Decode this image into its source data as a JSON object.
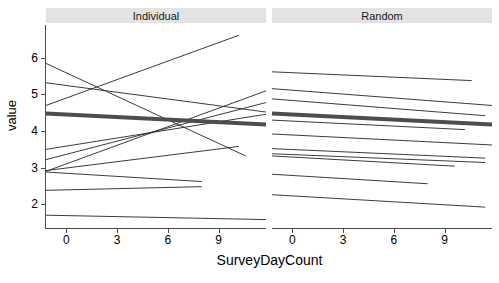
{
  "chart_data": {
    "type": "line",
    "title": "",
    "xlabel": "SurveyDayCount",
    "ylabel": "value",
    "xlim": [
      -1.2,
      11.8
    ],
    "ylim": [
      1.35,
      6.9
    ],
    "grid": false,
    "legend": false,
    "xticks": [
      0,
      3,
      6,
      9
    ],
    "yticks": [
      2,
      3,
      4,
      5,
      6
    ],
    "xtick_labels": [
      "0",
      "3",
      "6",
      "9"
    ],
    "ytick_labels": [
      "2",
      "3",
      "4",
      "5",
      "6"
    ],
    "facets": [
      {
        "label": "Individual",
        "average_line": {
          "name": "population average",
          "color": "#4d4d4d",
          "width": 4,
          "x": [
            -1.2,
            11.8
          ],
          "y": [
            4.48,
            4.18
          ]
        },
        "series": [
          {
            "name": "subject-1",
            "x": [
              -1.2,
              10.6
            ],
            "y": [
              5.85,
              3.32
            ]
          },
          {
            "name": "subject-2",
            "x": [
              -1.2,
              11.8
            ],
            "y": [
              5.32,
              4.52
            ]
          },
          {
            "name": "subject-3",
            "x": [
              -1.2,
              10.2
            ],
            "y": [
              4.7,
              6.62
            ]
          },
          {
            "name": "subject-4",
            "x": [
              -1.2,
              11.8
            ],
            "y": [
              3.5,
              4.46
            ]
          },
          {
            "name": "subject-5",
            "x": [
              -1.2,
              11.8
            ],
            "y": [
              3.22,
              4.78
            ]
          },
          {
            "name": "subject-6",
            "x": [
              -1.2,
              8.0
            ],
            "y": [
              2.88,
              2.62
            ]
          },
          {
            "name": "subject-7",
            "x": [
              -1.2,
              11.8
            ],
            "y": [
              2.9,
              5.1
            ]
          },
          {
            "name": "subject-8",
            "x": [
              -1.2,
              10.2
            ],
            "y": [
              2.92,
              3.58
            ]
          },
          {
            "name": "subject-9",
            "x": [
              -1.2,
              8.0
            ],
            "y": [
              2.38,
              2.48
            ]
          },
          {
            "name": "subject-10",
            "x": [
              -1.2,
              11.8
            ],
            "y": [
              1.7,
              1.58
            ]
          }
        ]
      },
      {
        "label": "Random",
        "average_line": {
          "name": "population average",
          "color": "#4d4d4d",
          "width": 4,
          "x": [
            -1.2,
            11.8
          ],
          "y": [
            4.48,
            4.18
          ]
        },
        "series": [
          {
            "name": "subject-1",
            "x": [
              -1.2,
              10.6
            ],
            "y": [
              5.62,
              5.38
            ]
          },
          {
            "name": "subject-2",
            "x": [
              -1.2,
              11.8
            ],
            "y": [
              5.16,
              4.7
            ]
          },
          {
            "name": "subject-3",
            "x": [
              -1.2,
              11.4
            ],
            "y": [
              4.88,
              4.42
            ]
          },
          {
            "name": "subject-4",
            "x": [
              -1.2,
              10.2
            ],
            "y": [
              4.3,
              4.04
            ]
          },
          {
            "name": "subject-5",
            "x": [
              -1.2,
              11.8
            ],
            "y": [
              3.92,
              3.62
            ]
          },
          {
            "name": "subject-6",
            "x": [
              -1.2,
              11.4
            ],
            "y": [
              3.52,
              3.26
            ]
          },
          {
            "name": "subject-7",
            "x": [
              -1.2,
              11.4
            ],
            "y": [
              3.38,
              3.14
            ]
          },
          {
            "name": "subject-8",
            "x": [
              -1.2,
              9.6
            ],
            "y": [
              3.32,
              3.04
            ]
          },
          {
            "name": "subject-9",
            "x": [
              -1.2,
              8.0
            ],
            "y": [
              2.82,
              2.56
            ]
          },
          {
            "name": "subject-10",
            "x": [
              -1.2,
              11.4
            ],
            "y": [
              2.26,
              1.92
            ]
          }
        ]
      }
    ]
  },
  "geometry": {
    "plot_top": 25,
    "plot_bottom": 228,
    "panel_left_x0": 46,
    "panel_left_x1": 266,
    "panel_right_x0": 272,
    "panel_right_x1": 492
  }
}
